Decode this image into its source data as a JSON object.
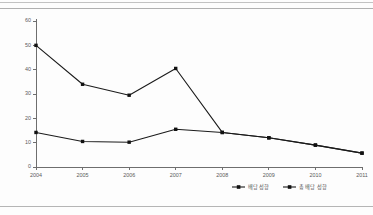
{
  "chart_data": {
    "type": "line",
    "title": "",
    "xlabel": "",
    "ylabel": "",
    "categories": [
      "2004",
      "2005",
      "2006",
      "2007",
      "2008",
      "2009",
      "2010",
      "2011"
    ],
    "ylim": [
      0,
      60
    ],
    "yticks": [
      0,
      10,
      20,
      30,
      40,
      50,
      60
    ],
    "grid": false,
    "legend_position": "bottom-right",
    "series": [
      {
        "name": "배당 성향",
        "marker": "square",
        "color": "#111111",
        "values": [
          14.2,
          10.5,
          10.2,
          15.5,
          14.2,
          12.0,
          9.0,
          5.7
        ]
      },
      {
        "name": "총 배당 성향",
        "marker": "square",
        "color": "#111111",
        "values": [
          50.0,
          34.0,
          29.5,
          40.5,
          14.2,
          12.0,
          9.0,
          5.7
        ]
      }
    ]
  },
  "axis": {
    "y_tick_labels": [
      "0",
      "10",
      "20",
      "30",
      "40",
      "50",
      "60"
    ],
    "x_tick_labels": [
      "2004",
      "2005",
      "2006",
      "2007",
      "2008",
      "2009",
      "2010",
      "2011"
    ]
  },
  "legend": {
    "entries": [
      {
        "label": "배당 성향"
      },
      {
        "label": "총 배당 성향"
      }
    ]
  }
}
